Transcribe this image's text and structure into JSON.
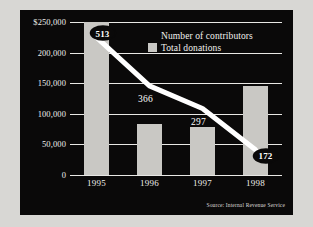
{
  "chart_data": {
    "type": "bar",
    "title": "",
    "subtitle": "",
    "xlabel": "",
    "ylabel": "",
    "categories": [
      "1995",
      "1996",
      "1997",
      "1998"
    ],
    "ylim": [
      0,
      250000
    ],
    "y_ticks": [
      0,
      50000,
      100000,
      150000,
      200000,
      250000
    ],
    "y_tick_labels": [
      "0",
      "50,000",
      "100,000",
      "150,000",
      "200,000",
      "$250,000"
    ],
    "grid": true,
    "legend_position": "top-right",
    "series": [
      {
        "name": "Total donations",
        "type": "bar",
        "color": "#c9c8c4",
        "values": [
          250000,
          83000,
          78000,
          145000
        ]
      },
      {
        "name": "Number of contributors",
        "type": "line",
        "color": "#ffffff",
        "values": [
          513,
          366,
          297,
          172
        ],
        "point_labels": [
          "513",
          "366",
          "297",
          "172"
        ],
        "label_styles": [
          "badge",
          "plain",
          "plain",
          "badge"
        ]
      }
    ],
    "annotations": [
      {
        "text": "Source: Internal Revenue Service",
        "position": "bottom-right"
      }
    ]
  },
  "axes": {
    "y_labels": [
      {
        "text": "$250,000",
        "value": 250000
      },
      {
        "text": "200,000",
        "value": 200000
      },
      {
        "text": "150,000",
        "value": 150000
      },
      {
        "text": "100,000",
        "value": 100000
      },
      {
        "text": "50,000",
        "value": 50000
      },
      {
        "text": "0",
        "value": 0
      }
    ],
    "x_labels": [
      "1995",
      "1996",
      "1997",
      "1998"
    ]
  },
  "legend": {
    "items": [
      {
        "label": "Number of contributors",
        "marker": "none",
        "color": "#ffffff"
      },
      {
        "label": "Total donations",
        "marker": "box",
        "color": "#c9c8c4"
      }
    ]
  },
  "footer": {
    "source": "Source: Internal Revenue Service"
  },
  "colors": {
    "panel_background": "#0a0909",
    "page_background": "#d8d7d4",
    "bar_fill": "#c9c8c4",
    "line_stroke": "#ffffff",
    "grid_stroke": "#e8e7e4",
    "text": "#efeeea"
  }
}
